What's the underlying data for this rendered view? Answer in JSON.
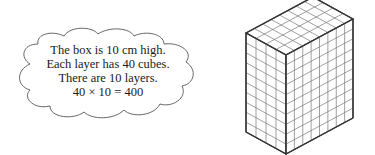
{
  "thought_bubble": {
    "lines": [
      "The box is 10 cm high.",
      "Each layer has 40 cubes.",
      "There are 10 layers.",
      "40 × 10 = 400"
    ]
  },
  "box": {
    "description": "isometric rectangular prism built from unit cubes",
    "layers": 10,
    "cubes_per_layer": 40,
    "front_left_columns": 4,
    "front_right_columns": 8
  },
  "colors": {
    "stroke": "#333333",
    "grid": "#777777",
    "cloud_stroke": "#555555"
  }
}
